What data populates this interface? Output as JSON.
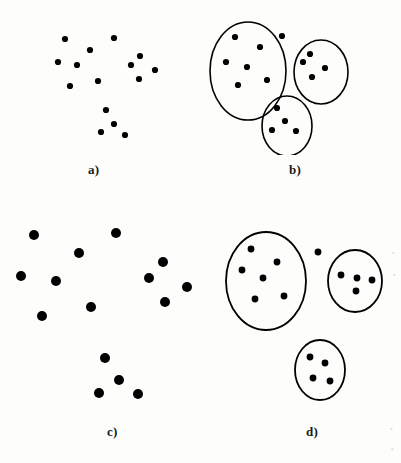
{
  "figure": {
    "width": 401,
    "height": 463,
    "background_color": "#fdfdfc",
    "ink_color": "#000000"
  },
  "panels": [
    {
      "id": "a",
      "label": "a)",
      "label_x": 88,
      "label_y": 162,
      "origin_x": 0,
      "origin_y": 0,
      "width": 200,
      "height": 155,
      "dot_radius": 3.1,
      "ellipses": [],
      "points": [
        {
          "x": 65,
          "y": 39
        },
        {
          "x": 114,
          "y": 38
        },
        {
          "x": 90,
          "y": 50
        },
        {
          "x": 58,
          "y": 62
        },
        {
          "x": 77,
          "y": 65
        },
        {
          "x": 140,
          "y": 56
        },
        {
          "x": 131,
          "y": 65
        },
        {
          "x": 155,
          "y": 70
        },
        {
          "x": 139,
          "y": 79
        },
        {
          "x": 98,
          "y": 81
        },
        {
          "x": 70,
          "y": 86
        },
        {
          "x": 106,
          "y": 110
        },
        {
          "x": 114,
          "y": 124
        },
        {
          "x": 101,
          "y": 132
        },
        {
          "x": 125,
          "y": 135
        }
      ]
    },
    {
      "id": "b",
      "label": "b)",
      "label_x": 289,
      "label_y": 162,
      "origin_x": 200,
      "origin_y": 0,
      "width": 201,
      "height": 155,
      "dot_radius": 3.1,
      "ellipses": [
        {
          "cx": 48,
          "cy": 71,
          "rx": 38,
          "ry": 49,
          "stroke_width": 1.6
        },
        {
          "cx": 121,
          "cy": 72,
          "rx": 27,
          "ry": 32,
          "stroke_width": 1.6
        },
        {
          "cx": 87,
          "cy": 126,
          "rx": 25,
          "ry": 30,
          "stroke_width": 1.6
        }
      ],
      "points": [
        {
          "x": 35,
          "y": 37,
          "cluster": 0
        },
        {
          "x": 60,
          "y": 47,
          "cluster": 0
        },
        {
          "x": 26,
          "y": 62,
          "cluster": 0
        },
        {
          "x": 47,
          "y": 67,
          "cluster": 0
        },
        {
          "x": 38,
          "y": 85,
          "cluster": 0
        },
        {
          "x": 67,
          "y": 80,
          "cluster": 0
        },
        {
          "x": 82,
          "y": 36,
          "cluster": null
        },
        {
          "x": 110,
          "y": 54,
          "cluster": 1
        },
        {
          "x": 103,
          "y": 62,
          "cluster": 1
        },
        {
          "x": 125,
          "y": 68,
          "cluster": 1
        },
        {
          "x": 112,
          "y": 77,
          "cluster": 1
        },
        {
          "x": 77,
          "y": 108,
          "cluster": 2
        },
        {
          "x": 85,
          "y": 121,
          "cluster": 2
        },
        {
          "x": 72,
          "y": 130,
          "cluster": 2
        },
        {
          "x": 96,
          "y": 131,
          "cluster": 2
        }
      ]
    },
    {
      "id": "c",
      "label": "c)",
      "label_x": 107,
      "label_y": 424,
      "origin_x": 0,
      "origin_y": 200,
      "width": 200,
      "height": 215,
      "dot_radius": 5.0,
      "ellipses": [],
      "points": [
        {
          "x": 34,
          "y": 35
        },
        {
          "x": 116,
          "y": 33
        },
        {
          "x": 79,
          "y": 53
        },
        {
          "x": 21,
          "y": 76
        },
        {
          "x": 56,
          "y": 81
        },
        {
          "x": 163,
          "y": 62
        },
        {
          "x": 149,
          "y": 78
        },
        {
          "x": 187,
          "y": 87
        },
        {
          "x": 165,
          "y": 102
        },
        {
          "x": 91,
          "y": 107
        },
        {
          "x": 42,
          "y": 116
        },
        {
          "x": 105,
          "y": 158
        },
        {
          "x": 119,
          "y": 180
        },
        {
          "x": 99,
          "y": 193
        },
        {
          "x": 138,
          "y": 194
        }
      ]
    },
    {
      "id": "d",
      "label": "d)",
      "label_x": 306,
      "label_y": 424,
      "origin_x": 200,
      "origin_y": 200,
      "width": 201,
      "height": 215,
      "dot_radius": 3.4,
      "ellipses": [
        {
          "cx": 66,
          "cy": 81,
          "rx": 40,
          "ry": 49,
          "stroke_width": 1.8
        },
        {
          "cx": 155,
          "cy": 81,
          "rx": 27,
          "ry": 31,
          "stroke_width": 1.8
        },
        {
          "cx": 120,
          "cy": 170,
          "rx": 25,
          "ry": 30,
          "stroke_width": 1.8
        }
      ],
      "points": [
        {
          "x": 51,
          "y": 49,
          "cluster": 0
        },
        {
          "x": 77,
          "y": 62,
          "cluster": 0
        },
        {
          "x": 42,
          "y": 70,
          "cluster": 0
        },
        {
          "x": 63,
          "y": 78,
          "cluster": 0
        },
        {
          "x": 55,
          "y": 99,
          "cluster": 0
        },
        {
          "x": 84,
          "y": 96,
          "cluster": 0
        },
        {
          "x": 118,
          "y": 52,
          "cluster": null
        },
        {
          "x": 141,
          "y": 75,
          "cluster": 1
        },
        {
          "x": 157,
          "y": 78,
          "cluster": 1
        },
        {
          "x": 172,
          "y": 80,
          "cluster": 1
        },
        {
          "x": 156,
          "y": 91,
          "cluster": 1
        },
        {
          "x": 110,
          "y": 157,
          "cluster": 2
        },
        {
          "x": 125,
          "y": 163,
          "cluster": 2
        },
        {
          "x": 113,
          "y": 178,
          "cluster": 2
        },
        {
          "x": 130,
          "y": 181,
          "cluster": 2
        }
      ]
    }
  ]
}
